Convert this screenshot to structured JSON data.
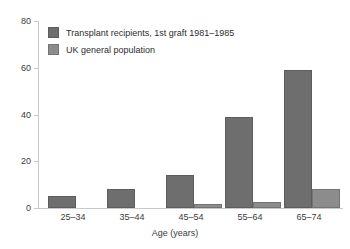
{
  "chart_data": {
    "type": "bar",
    "title": "",
    "subtitle": "",
    "xlabel": "Age (years)",
    "ylabel": "",
    "categories": [
      "25–34",
      "35–44",
      "45–54",
      "55–64",
      "65–74"
    ],
    "series": [
      {
        "name": "Transplant recipients, 1st graft 1981–1985",
        "color": "#6e6e6e",
        "values": [
          5,
          8,
          14,
          39,
          59
        ]
      },
      {
        "name": "UK general population",
        "color": "#8c8c8c",
        "values": [
          0,
          0,
          1.5,
          2.5,
          8
        ]
      }
    ],
    "ylim": [
      0,
      80
    ],
    "yticks": [
      0,
      20,
      40,
      60,
      80
    ],
    "ytick_labels": [
      "0",
      "20",
      "40",
      "60",
      "80"
    ],
    "grid": false,
    "legend_position": "top-left-inside"
  },
  "axes": {
    "y_tick_labels": [
      "80",
      "60",
      "40",
      "20",
      "0"
    ],
    "x_tick_labels": [
      "25–34",
      "35–44",
      "45–54",
      "55–64",
      "65–74"
    ],
    "x_axis_title": "Age (years)"
  },
  "legend": {
    "entries": [
      {
        "label": "Transplant recipients, 1st graft 1981–1985",
        "swatch": "series-0-swatch"
      },
      {
        "label": "UK general population",
        "swatch": "series-1-swatch"
      }
    ]
  }
}
